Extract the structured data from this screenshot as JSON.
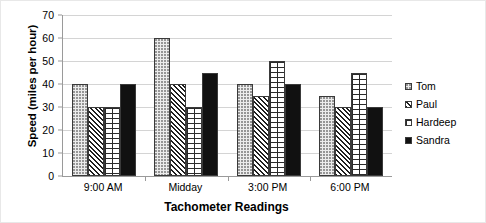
{
  "chart_data": {
    "type": "bar",
    "title": "",
    "subtitle": "",
    "xlabel": "Tachometer Readings",
    "ylabel": "Speed (miles per hour)",
    "categories": [
      "9:00 AM",
      "Midday",
      "3:00 PM",
      "6:00 PM"
    ],
    "series": [
      {
        "name": "Tom",
        "values": [
          40,
          60,
          40,
          35
        ],
        "pattern": "dots",
        "color": "#ececec"
      },
      {
        "name": "Paul",
        "values": [
          30,
          40,
          35,
          30
        ],
        "pattern": "diagonal-hatch",
        "color": "#ffffff"
      },
      {
        "name": "Hardeep",
        "values": [
          30,
          30,
          50,
          45
        ],
        "pattern": "brick",
        "color": "#ffffff"
      },
      {
        "name": "Sandra",
        "values": [
          40,
          45,
          40,
          30
        ],
        "pattern": "solid-black",
        "color": "#111111"
      }
    ],
    "ylim": [
      0,
      70
    ],
    "ytick_step": 10,
    "yticks": [
      0,
      10,
      20,
      30,
      40,
      50,
      60,
      70
    ],
    "ytick_labels": [
      "0",
      "10",
      "20",
      "30",
      "40",
      "50",
      "60",
      "70"
    ],
    "grid": true,
    "grid_axis": "y",
    "legend_position": "right"
  },
  "legend": {
    "items": [
      {
        "label": "Tom"
      },
      {
        "label": "Paul"
      },
      {
        "label": "Hardeep"
      },
      {
        "label": "Sandra"
      }
    ]
  }
}
